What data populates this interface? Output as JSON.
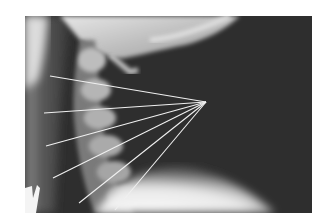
{
  "figure": {
    "background_color": "#ffffff",
    "image_colors": {
      "soft_tissue_dark": "#2e2e2e",
      "bone_light": "#d8d8d8",
      "shoulder_bright": "#f4f4f4",
      "line_color": "#f0f0f0"
    },
    "convergence_point": {
      "x": 206,
      "y": 102
    },
    "lines": [
      {
        "x1": 50,
        "y1": 76
      },
      {
        "x1": 44,
        "y1": 113
      },
      {
        "x1": 46,
        "y1": 146
      },
      {
        "x1": 53,
        "y1": 178
      },
      {
        "x1": 79,
        "y1": 203
      },
      {
        "x1": 115,
        "y1": 210
      }
    ],
    "marker": {
      "shape": "partial-letter",
      "color": "#f4f4f4"
    }
  }
}
